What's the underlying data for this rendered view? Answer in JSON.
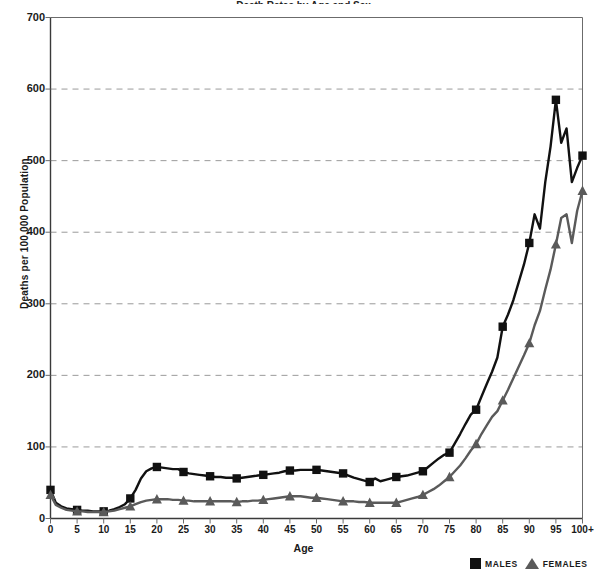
{
  "chart_data": {
    "type": "line",
    "title": "Death Rates by Age and Sex",
    "xlabel": "Age",
    "ylabel": "Deaths per 100,000 Population",
    "ylim": [
      0,
      700
    ],
    "ytick_values": [
      0,
      100,
      200,
      300,
      400,
      500,
      600,
      700
    ],
    "ytick_labels": [
      "0",
      "100",
      "200",
      "300",
      "400",
      "500",
      "600",
      "700"
    ],
    "xlim": [
      0,
      100
    ],
    "xtick_values": [
      0,
      5,
      10,
      15,
      20,
      25,
      30,
      35,
      40,
      45,
      50,
      55,
      60,
      65,
      70,
      75,
      80,
      85,
      90,
      95,
      100
    ],
    "xtick_labels": [
      "0",
      "5",
      "10",
      "15",
      "20",
      "25",
      "30",
      "35",
      "40",
      "45",
      "50",
      "55",
      "60",
      "65",
      "70",
      "75",
      "80",
      "85",
      "90",
      "95",
      "100+"
    ],
    "grid": "horizontal-dashed",
    "legend_position": "bottom-right",
    "marker_interval": 5,
    "x": [
      0,
      1,
      2,
      3,
      4,
      5,
      6,
      7,
      8,
      9,
      10,
      11,
      12,
      13,
      14,
      15,
      16,
      17,
      18,
      19,
      20,
      21,
      22,
      23,
      24,
      25,
      26,
      27,
      28,
      29,
      30,
      31,
      32,
      33,
      34,
      35,
      36,
      37,
      38,
      39,
      40,
      41,
      42,
      43,
      44,
      45,
      46,
      47,
      48,
      49,
      50,
      51,
      52,
      53,
      54,
      55,
      56,
      57,
      58,
      59,
      60,
      61,
      62,
      63,
      64,
      65,
      66,
      67,
      68,
      69,
      70,
      71,
      72,
      73,
      74,
      75,
      76,
      77,
      78,
      79,
      80,
      81,
      82,
      83,
      84,
      85,
      86,
      87,
      88,
      89,
      90,
      91,
      92,
      93,
      94,
      95,
      96,
      97,
      98,
      99,
      100
    ],
    "series": [
      {
        "name": "MALES",
        "color": "#111111",
        "marker": "square",
        "values": [
          40,
          22,
          17,
          14,
          13,
          12,
          11,
          11,
          10,
          10,
          10,
          11,
          13,
          16,
          20,
          28,
          40,
          56,
          66,
          70,
          72,
          71,
          70,
          69,
          69,
          65,
          63,
          62,
          61,
          60,
          59,
          58,
          58,
          57,
          57,
          56,
          57,
          58,
          59,
          60,
          61,
          62,
          63,
          64,
          66,
          67,
          67,
          68,
          68,
          68,
          68,
          67,
          66,
          65,
          64,
          63,
          60,
          57,
          55,
          53,
          51,
          56,
          52,
          54,
          56,
          58,
          59,
          60,
          62,
          64,
          66,
          72,
          78,
          84,
          89,
          92,
          105,
          118,
          132,
          145,
          152,
          170,
          188,
          205,
          225,
          268,
          285,
          305,
          330,
          355,
          385,
          425,
          405,
          470,
          520,
          585,
          525,
          545,
          470,
          490,
          507
        ]
      },
      {
        "name": "FEMALES",
        "color": "#5a5a5a",
        "marker": "triangle",
        "values": [
          33,
          19,
          15,
          12,
          11,
          10,
          10,
          9,
          9,
          9,
          9,
          10,
          11,
          13,
          15,
          17,
          20,
          23,
          25,
          26,
          27,
          27,
          27,
          26,
          26,
          25,
          25,
          24,
          24,
          24,
          24,
          24,
          24,
          24,
          24,
          23,
          24,
          24,
          25,
          25,
          26,
          27,
          28,
          29,
          30,
          31,
          31,
          31,
          30,
          29,
          29,
          28,
          27,
          26,
          25,
          24,
          24,
          24,
          23,
          23,
          22,
          22,
          22,
          22,
          22,
          22,
          24,
          26,
          28,
          30,
          33,
          37,
          41,
          46,
          52,
          58,
          66,
          74,
          84,
          95,
          104,
          118,
          130,
          142,
          150,
          165,
          180,
          196,
          212,
          228,
          245,
          270,
          290,
          320,
          348,
          383,
          420,
          425,
          385,
          430,
          458
        ]
      }
    ]
  },
  "axes": {
    "y_title": "Deaths per 100,000 Population",
    "x_title": "Age"
  },
  "legend": {
    "males_label": "MALES",
    "females_label": "FEMALES"
  }
}
